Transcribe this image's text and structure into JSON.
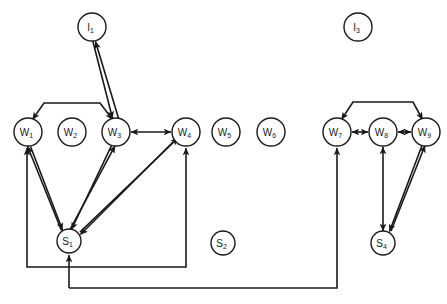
{
  "diagram": {
    "background_color": "#ffffff",
    "stroke_color": "#1a1a1a",
    "nodes": [
      {
        "id": "I1",
        "base": "I",
        "sub": "1",
        "cx": 92,
        "cy": 27,
        "r": 14
      },
      {
        "id": "I3",
        "base": "I",
        "sub": "3",
        "cx": 358,
        "cy": 27,
        "r": 14
      },
      {
        "id": "W1",
        "base": "W",
        "sub": "1",
        "cx": 28,
        "cy": 132,
        "r": 14
      },
      {
        "id": "W2",
        "base": "W",
        "sub": "2",
        "cx": 72,
        "cy": 132,
        "r": 14
      },
      {
        "id": "W3",
        "base": "W",
        "sub": "3",
        "cx": 116,
        "cy": 132,
        "r": 14
      },
      {
        "id": "W4",
        "base": "W",
        "sub": "4",
        "cx": 186,
        "cy": 132,
        "r": 14
      },
      {
        "id": "W5",
        "base": "W",
        "sub": "5",
        "cx": 226,
        "cy": 132,
        "r": 14
      },
      {
        "id": "W6",
        "base": "W",
        "sub": "6",
        "cx": 271,
        "cy": 132,
        "r": 14
      },
      {
        "id": "W7",
        "base": "W",
        "sub": "7",
        "cx": 337,
        "cy": 132,
        "r": 14
      },
      {
        "id": "W8",
        "base": "W",
        "sub": "8",
        "cx": 383,
        "cy": 132,
        "r": 14
      },
      {
        "id": "W9",
        "base": "W",
        "sub": "9",
        "cx": 426,
        "cy": 132,
        "r": 14
      },
      {
        "id": "S1",
        "base": "S",
        "sub": "1",
        "cx": 69,
        "cy": 241,
        "r": 12
      },
      {
        "id": "S2",
        "base": "S",
        "sub": "2",
        "cx": 223,
        "cy": 243,
        "r": 12
      },
      {
        "id": "S4",
        "base": "S",
        "sub": "4",
        "cx": 383,
        "cy": 243,
        "r": 12
      }
    ],
    "edges": [
      {
        "name": "w3-to-i1",
        "from": "W3",
        "to": "I1",
        "kind": "arrow-up"
      },
      {
        "name": "i1-to-w3",
        "from": "I1",
        "to": "W3",
        "kind": "arrow-down"
      },
      {
        "name": "bracket-w1-w3",
        "from": "W1",
        "to": "W3",
        "kind": "bracket-both-down"
      },
      {
        "name": "w3-w4",
        "from": "W3",
        "to": "W4",
        "kind": "bidirectional"
      },
      {
        "name": "w1-to-s1",
        "from": "W1",
        "to": "S1",
        "kind": "arrow"
      },
      {
        "name": "s1-to-w1",
        "from": "S1",
        "to": "W1",
        "kind": "arrow"
      },
      {
        "name": "w3-to-s1",
        "from": "W3",
        "to": "S1",
        "kind": "arrow"
      },
      {
        "name": "s1-to-w3",
        "from": "S1",
        "to": "W3",
        "kind": "arrow"
      },
      {
        "name": "w4-to-s1",
        "from": "W4",
        "to": "S1",
        "kind": "arrow"
      },
      {
        "name": "s1-to-w4",
        "from": "S1",
        "to": "W4",
        "kind": "arrow"
      },
      {
        "name": "loop-s1-w1",
        "from": "S1",
        "to": "W1",
        "kind": "routed-loop"
      },
      {
        "name": "loop-s1-w4",
        "from": "S1",
        "to": "W4",
        "kind": "routed-loop"
      },
      {
        "name": "loop-s1-w7",
        "from": "S1",
        "to": "W7",
        "kind": "routed-loop-long"
      },
      {
        "name": "bracket-w7-w9",
        "from": "W7",
        "to": "W9",
        "kind": "bracket-both-down"
      },
      {
        "name": "w7-w8",
        "from": "W7",
        "to": "W8",
        "kind": "bidirectional"
      },
      {
        "name": "w8-w9",
        "from": "W8",
        "to": "W9",
        "kind": "bidirectional"
      },
      {
        "name": "w8-s4",
        "from": "W8",
        "to": "S4",
        "kind": "bidirectional-vertical"
      },
      {
        "name": "w9-to-s4",
        "from": "W9",
        "to": "S4",
        "kind": "arrow"
      },
      {
        "name": "s4-to-w9",
        "from": "S4",
        "to": "W9",
        "kind": "arrow"
      }
    ]
  }
}
